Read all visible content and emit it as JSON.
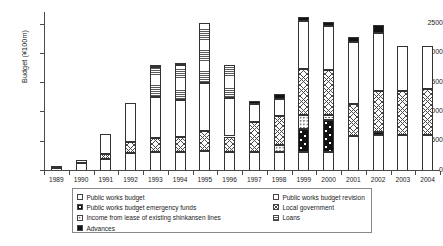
{
  "chart_data": {
    "type": "bar",
    "subtype": "stacked",
    "title": "",
    "xlabel": "",
    "ylabel": "Budget (¥100m)",
    "ylim": [
      0,
      2700
    ],
    "yticks": [
      0,
      500,
      1000,
      1500,
      2000,
      2500
    ],
    "ytick_labels": [
      "0",
      "500",
      "1000",
      "1500",
      "2000",
      "2500"
    ],
    "grid": false,
    "legend_position": "below-center",
    "categories": [
      "1989",
      "1990",
      "1991",
      "1992",
      "1993",
      "1994",
      "1995",
      "1996",
      "1997",
      "1998",
      "1999",
      "2000",
      "2001",
      "2002",
      "2003",
      "2004"
    ],
    "series": [
      {
        "name": "Public works budget",
        "pattern": "plain-white",
        "values": [
          60,
          140,
          210,
          310,
          330,
          330,
          350,
          330,
          330,
          330,
          330,
          330,
          600,
          610,
          620,
          620
        ]
      },
      {
        "name": "Public works budget emergency funds",
        "pattern": "black-with-white-dots",
        "values": [
          0,
          0,
          0,
          0,
          0,
          0,
          0,
          0,
          0,
          0,
          390,
          540,
          0,
          60,
          0,
          0
        ]
      },
      {
        "name": "Income from lease of existing shinkansen lines",
        "pattern": "light-dots",
        "values": [
          0,
          0,
          0,
          0,
          0,
          0,
          0,
          0,
          0,
          110,
          230,
          90,
          0,
          0,
          0,
          0
        ]
      },
      {
        "name": "Local government",
        "pattern": "cross-hatch",
        "values": [
          0,
          0,
          80,
          190,
          230,
          250,
          330,
          260,
          510,
          500,
          800,
          770,
          540,
          700,
          740,
          790
        ]
      },
      {
        "name": "Loans",
        "pattern": "horizontal-lines",
        "values": [
          0,
          0,
          0,
          0,
          0,
          0,
          0,
          0,
          0,
          0,
          0,
          0,
          0,
          0,
          0,
          0
        ]
      },
      {
        "name": "Public works budget revision",
        "pattern": "fine-vertical-lines",
        "values": [
          20,
          50,
          350,
          660,
          700,
          640,
          830,
          660,
          300,
          290,
          810,
          740,
          1060,
          990,
          780,
          720
        ]
      },
      {
        "name": "Loans (horizontal hatch)",
        "pattern": "horizontal-lines",
        "values": [
          0,
          0,
          0,
          0,
          520,
          590,
          1020,
          570,
          0,
          0,
          0,
          0,
          0,
          0,
          0,
          0
        ]
      },
      {
        "name": "Advances",
        "pattern": "solid-black",
        "values": [
          0,
          0,
          0,
          0,
          40,
          40,
          0,
          0,
          60,
          80,
          80,
          80,
          90,
          130,
          0,
          0
        ]
      }
    ],
    "totals": [
      80,
      190,
      640,
      1160,
      1820,
      1850,
      2530,
      1820,
      1200,
      1310,
      2640,
      2550,
      2290,
      2490,
      2140,
      2130
    ]
  },
  "legend": {
    "left_column": [
      {
        "label": "Public works budget",
        "pattern": "plain-white"
      },
      {
        "label": "Public works budget emergency funds",
        "pattern": "black-with-white-dots"
      },
      {
        "label": "Income from lease of existing shinkansen lines",
        "pattern": "light-dots"
      },
      {
        "label": "Advances",
        "pattern": "solid-black"
      }
    ],
    "right_column": [
      {
        "label": "Public works budget revision",
        "pattern": "fine-vertical-lines"
      },
      {
        "label": "Local government",
        "pattern": "cross-hatch"
      },
      {
        "label": "Loans",
        "pattern": "horizontal-lines"
      }
    ]
  }
}
